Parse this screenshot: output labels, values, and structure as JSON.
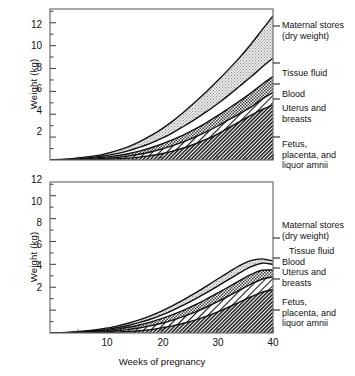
{
  "figure": {
    "axis_y_title": "Weight (kg)",
    "axis_x_title": "Weeks of pregnancy",
    "y_ticks": [
      "2",
      "4",
      "6",
      "8",
      "10",
      "12"
    ],
    "x_ticks": [
      "10",
      "20",
      "30",
      "40"
    ],
    "legend_labels": {
      "maternal_1": "Maternal stores",
      "maternal_2": "(dry weight)",
      "tissue_fluid": "Tissue fluid",
      "blood": "Blood",
      "uterus_1": "Uterus and",
      "uterus_2": "breasts",
      "fetus_1": "Fetus,",
      "fetus_2": "placenta, and",
      "fetus_3": "liquor amnii"
    }
  },
  "chart_data": [
    {
      "type": "area",
      "title": "",
      "panel": "top",
      "xlabel": "",
      "ylabel": "Weight (kg)",
      "xlim": [
        0,
        40
      ],
      "ylim": [
        0,
        13.2
      ],
      "ytick_values": [
        2,
        4,
        6,
        8,
        10,
        12
      ],
      "xtick_values": [
        10,
        20,
        30,
        40
      ],
      "grid": false,
      "legend_position": "right",
      "x": [
        0,
        4,
        8,
        10,
        12,
        14,
        16,
        18,
        20,
        22,
        24,
        26,
        28,
        30,
        32,
        34,
        36,
        38,
        40
      ],
      "series": [
        {
          "name": "Fetus, placenta, and liquor amnii",
          "cumulative": [
            0,
            0.0,
            0.02,
            0.05,
            0.1,
            0.16,
            0.25,
            0.38,
            0.55,
            0.78,
            1.05,
            1.4,
            1.8,
            2.25,
            2.8,
            3.35,
            3.9,
            4.4,
            4.8
          ],
          "pattern": "dense-diagonal-hatch"
        },
        {
          "name": "Uterus and breasts",
          "cumulative": [
            0,
            0.02,
            0.08,
            0.14,
            0.22,
            0.34,
            0.5,
            0.7,
            0.95,
            1.25,
            1.6,
            2.0,
            2.45,
            2.95,
            3.5,
            4.05,
            4.6,
            5.3,
            5.9
          ],
          "pattern": "diagonal-hatch-white"
        },
        {
          "name": "Blood",
          "cumulative": [
            0,
            0.05,
            0.16,
            0.25,
            0.38,
            0.55,
            0.78,
            1.05,
            1.38,
            1.78,
            2.2,
            2.7,
            3.25,
            3.85,
            4.5,
            5.15,
            5.85,
            6.6,
            7.3
          ],
          "pattern": "checkered"
        },
        {
          "name": "Tissue fluid",
          "cumulative": [
            0,
            0.08,
            0.25,
            0.38,
            0.56,
            0.8,
            1.1,
            1.45,
            1.88,
            2.38,
            2.95,
            3.55,
            4.2,
            4.9,
            5.65,
            6.45,
            7.25,
            8.1,
            8.9
          ],
          "pattern": "white"
        },
        {
          "name": "Maternal stores (dry weight)",
          "cumulative": [
            0,
            0.12,
            0.36,
            0.55,
            0.82,
            1.15,
            1.58,
            2.1,
            2.7,
            3.4,
            4.2,
            5.05,
            5.95,
            6.9,
            7.9,
            8.95,
            10.1,
            11.35,
            12.6
          ],
          "pattern": "light-stipple"
        }
      ]
    },
    {
      "type": "area",
      "title": "",
      "panel": "bottom",
      "xlabel": "Weeks of pregnancy",
      "ylabel": "Weight (kg)",
      "xlim": [
        0,
        40
      ],
      "ylim": [
        0,
        13.2
      ],
      "ytick_values": [
        2,
        4,
        6,
        8,
        10,
        12
      ],
      "xtick_values": [
        10,
        20,
        30,
        40
      ],
      "grid": false,
      "legend_position": "right",
      "x": [
        0,
        4,
        8,
        10,
        12,
        14,
        16,
        18,
        20,
        22,
        24,
        26,
        28,
        30,
        32,
        34,
        36,
        38,
        40
      ],
      "series": [
        {
          "name": "Fetus, placenta, and liquor amnii",
          "cumulative": [
            0,
            0.0,
            0.02,
            0.04,
            0.08,
            0.13,
            0.2,
            0.3,
            0.45,
            0.62,
            0.85,
            1.12,
            1.45,
            1.82,
            2.25,
            2.7,
            3.15,
            3.55,
            3.8
          ],
          "pattern": "dense-diagonal-hatch"
        },
        {
          "name": "Uterus and breasts",
          "cumulative": [
            0,
            0.02,
            0.07,
            0.12,
            0.2,
            0.3,
            0.44,
            0.62,
            0.85,
            1.12,
            1.45,
            1.82,
            2.25,
            2.72,
            3.22,
            3.75,
            4.25,
            4.7,
            4.9
          ],
          "pattern": "diagonal-hatch-white"
        },
        {
          "name": "Blood",
          "cumulative": [
            0,
            0.04,
            0.14,
            0.22,
            0.34,
            0.5,
            0.7,
            0.95,
            1.25,
            1.6,
            2.0,
            2.45,
            2.95,
            3.48,
            4.02,
            4.58,
            5.1,
            5.48,
            5.5
          ],
          "pattern": "checkered"
        },
        {
          "name": "Tissue fluid",
          "cumulative": [
            0,
            0.06,
            0.2,
            0.3,
            0.46,
            0.66,
            0.9,
            1.2,
            1.56,
            1.98,
            2.45,
            2.96,
            3.5,
            4.08,
            4.66,
            5.25,
            5.78,
            6.1,
            6.0
          ],
          "pattern": "white"
        },
        {
          "name": "Maternal stores (dry weight)",
          "cumulative": [
            0,
            0.08,
            0.26,
            0.4,
            0.6,
            0.85,
            1.14,
            1.5,
            1.92,
            2.4,
            2.92,
            3.48,
            4.08,
            4.7,
            5.3,
            5.88,
            6.32,
            6.48,
            6.3
          ],
          "pattern": "light-stipple"
        }
      ]
    }
  ]
}
